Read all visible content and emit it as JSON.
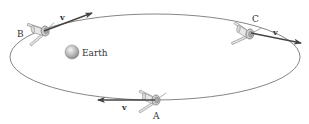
{
  "diagram": {
    "orbit": {
      "cx": 155,
      "cy": 57,
      "rx": 145,
      "ry": 43,
      "stroke": "#666666"
    },
    "earth": {
      "label": "Earth",
      "cx": 72,
      "cy": 52,
      "r": 7
    },
    "satellites": [
      {
        "id": "A",
        "label": "A",
        "velocity_label": "v",
        "x": 155,
        "y": 100
      },
      {
        "id": "B",
        "label": "B",
        "velocity_label": "v",
        "x": 45,
        "y": 30
      },
      {
        "id": "C",
        "label": "C",
        "velocity_label": "v",
        "x": 250,
        "y": 33
      }
    ],
    "colors": {
      "arrow": "#444444",
      "satellite_body": "#d8d8d8",
      "satellite_outline": "#7a7a7a",
      "earth_light": "#f0f0f0",
      "earth_dark": "#8a8a8a"
    }
  }
}
